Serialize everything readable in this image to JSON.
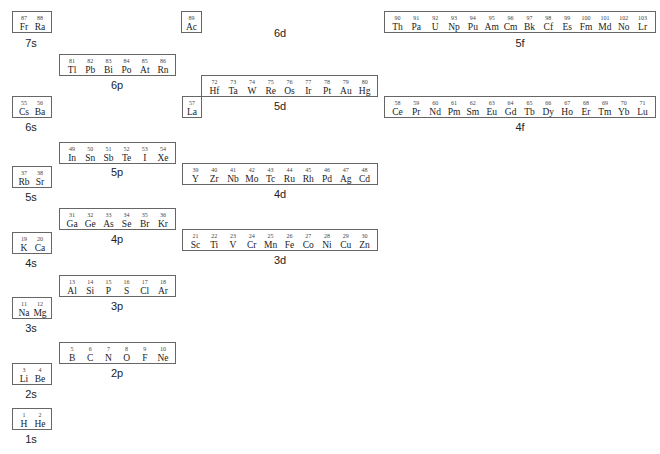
{
  "blocks": [
    {
      "id": "7s",
      "label": "7s",
      "x": 12,
      "y": 11,
      "w": 40,
      "h": 22,
      "lx": 31,
      "ly": 37,
      "elements": [
        {
          "n": "87",
          "s": "Fr"
        },
        {
          "n": "88",
          "s": "Ra"
        }
      ]
    },
    {
      "id": "6d",
      "label": "6d",
      "x": 181,
      "y": 11,
      "w": 21,
      "h": 22,
      "lx": 280,
      "ly": 27,
      "elements": [
        {
          "n": "89",
          "s": "Ac"
        }
      ]
    },
    {
      "id": "5f",
      "label": "5f",
      "x": 384,
      "y": 11,
      "w": 272,
      "h": 22,
      "lx": 520,
      "ly": 37,
      "elements": [
        {
          "n": "90",
          "s": "Th"
        },
        {
          "n": "91",
          "s": "Pa"
        },
        {
          "n": "92",
          "s": "U"
        },
        {
          "n": "93",
          "s": "Np"
        },
        {
          "n": "94",
          "s": "Pu"
        },
        {
          "n": "95",
          "s": "Am"
        },
        {
          "n": "96",
          "s": "Cm"
        },
        {
          "n": "97",
          "s": "Bk"
        },
        {
          "n": "98",
          "s": "Cf"
        },
        {
          "n": "99",
          "s": "Es"
        },
        {
          "n": "100",
          "s": "Fm"
        },
        {
          "n": "101",
          "s": "Md"
        },
        {
          "n": "102",
          "s": "No"
        },
        {
          "n": "103",
          "s": "Lr"
        }
      ]
    },
    {
      "id": "6p",
      "label": "6p",
      "x": 59,
      "y": 54,
      "w": 117,
      "h": 22,
      "lx": 117,
      "ly": 79,
      "elements": [
        {
          "n": "81",
          "s": "Tl"
        },
        {
          "n": "82",
          "s": "Pb"
        },
        {
          "n": "83",
          "s": "Bi"
        },
        {
          "n": "84",
          "s": "Po"
        },
        {
          "n": "85",
          "s": "At"
        },
        {
          "n": "86",
          "s": "Rn"
        }
      ]
    },
    {
      "id": "5d",
      "label": "5d",
      "x": 201,
      "y": 75,
      "w": 177,
      "h": 22,
      "lx": 280,
      "ly": 100,
      "elements": [
        {
          "n": "72",
          "s": "Hf"
        },
        {
          "n": "73",
          "s": "Ta"
        },
        {
          "n": "74",
          "s": "W"
        },
        {
          "n": "75",
          "s": "Re"
        },
        {
          "n": "76",
          "s": "Os"
        },
        {
          "n": "77",
          "s": "Ir"
        },
        {
          "n": "78",
          "s": "Pt"
        },
        {
          "n": "79",
          "s": "Au"
        },
        {
          "n": "80",
          "s": "Hg"
        }
      ]
    },
    {
      "id": "5d-La",
      "label": "",
      "x": 182,
      "y": 96,
      "w": 20,
      "h": 22,
      "lx": 0,
      "ly": 0,
      "elements": [
        {
          "n": "57",
          "s": "La"
        }
      ]
    },
    {
      "id": "6s",
      "label": "6s",
      "x": 12,
      "y": 96,
      "w": 40,
      "h": 22,
      "lx": 31,
      "ly": 121,
      "elements": [
        {
          "n": "55",
          "s": "Cs"
        },
        {
          "n": "56",
          "s": "Ba"
        }
      ]
    },
    {
      "id": "4f",
      "label": "4f",
      "x": 384,
      "y": 96,
      "w": 272,
      "h": 22,
      "lx": 520,
      "ly": 121,
      "elements": [
        {
          "n": "58",
          "s": "Ce"
        },
        {
          "n": "59",
          "s": "Pr"
        },
        {
          "n": "60",
          "s": "Nd"
        },
        {
          "n": "61",
          "s": "Pm"
        },
        {
          "n": "62",
          "s": "Sm"
        },
        {
          "n": "63",
          "s": "Eu"
        },
        {
          "n": "64",
          "s": "Gd"
        },
        {
          "n": "65",
          "s": "Tb"
        },
        {
          "n": "66",
          "s": "Dy"
        },
        {
          "n": "67",
          "s": "Ho"
        },
        {
          "n": "68",
          "s": "Er"
        },
        {
          "n": "69",
          "s": "Tm"
        },
        {
          "n": "70",
          "s": "Yb"
        },
        {
          "n": "71",
          "s": "Lu"
        }
      ]
    },
    {
      "id": "5p",
      "label": "5p",
      "x": 59,
      "y": 142,
      "w": 117,
      "h": 22,
      "lx": 117,
      "ly": 166,
      "elements": [
        {
          "n": "49",
          "s": "In"
        },
        {
          "n": "50",
          "s": "Sn"
        },
        {
          "n": "51",
          "s": "Sb"
        },
        {
          "n": "52",
          "s": "Te"
        },
        {
          "n": "53",
          "s": "I"
        },
        {
          "n": "54",
          "s": "Xe"
        }
      ]
    },
    {
      "id": "5s",
      "label": "5s",
      "x": 12,
      "y": 166,
      "w": 40,
      "h": 22,
      "lx": 31,
      "ly": 191,
      "elements": [
        {
          "n": "37",
          "s": "Rb"
        },
        {
          "n": "38",
          "s": "Sr"
        }
      ]
    },
    {
      "id": "4d",
      "label": "4d",
      "x": 182,
      "y": 163,
      "w": 196,
      "h": 22,
      "lx": 280,
      "ly": 188,
      "elements": [
        {
          "n": "39",
          "s": "Y"
        },
        {
          "n": "40",
          "s": "Zr"
        },
        {
          "n": "41",
          "s": "Nb"
        },
        {
          "n": "42",
          "s": "Mo"
        },
        {
          "n": "43",
          "s": "Tc"
        },
        {
          "n": "44",
          "s": "Ru"
        },
        {
          "n": "45",
          "s": "Rh"
        },
        {
          "n": "46",
          "s": "Pd"
        },
        {
          "n": "47",
          "s": "Ag"
        },
        {
          "n": "48",
          "s": "Cd"
        }
      ]
    },
    {
      "id": "4p",
      "label": "4p",
      "x": 59,
      "y": 208,
      "w": 117,
      "h": 22,
      "lx": 117,
      "ly": 233,
      "elements": [
        {
          "n": "31",
          "s": "Ga"
        },
        {
          "n": "32",
          "s": "Ge"
        },
        {
          "n": "33",
          "s": "As"
        },
        {
          "n": "34",
          "s": "Se"
        },
        {
          "n": "35",
          "s": "Br"
        },
        {
          "n": "36",
          "s": "Kr"
        }
      ]
    },
    {
      "id": "3d",
      "label": "3d",
      "x": 182,
      "y": 229,
      "w": 196,
      "h": 22,
      "lx": 280,
      "ly": 254,
      "elements": [
        {
          "n": "21",
          "s": "Sc"
        },
        {
          "n": "22",
          "s": "Ti"
        },
        {
          "n": "23",
          "s": "V"
        },
        {
          "n": "24",
          "s": "Cr"
        },
        {
          "n": "25",
          "s": "Mn"
        },
        {
          "n": "26",
          "s": "Fe"
        },
        {
          "n": "27",
          "s": "Co"
        },
        {
          "n": "28",
          "s": "Ni"
        },
        {
          "n": "29",
          "s": "Cu"
        },
        {
          "n": "30",
          "s": "Zn"
        }
      ]
    },
    {
      "id": "4s",
      "label": "4s",
      "x": 12,
      "y": 232,
      "w": 40,
      "h": 22,
      "lx": 31,
      "ly": 257,
      "elements": [
        {
          "n": "19",
          "s": "K"
        },
        {
          "n": "20",
          "s": "Ca"
        }
      ]
    },
    {
      "id": "3p",
      "label": "3p",
      "x": 59,
      "y": 275,
      "w": 117,
      "h": 22,
      "lx": 117,
      "ly": 300,
      "elements": [
        {
          "n": "13",
          "s": "Al"
        },
        {
          "n": "14",
          "s": "Si"
        },
        {
          "n": "15",
          "s": "P"
        },
        {
          "n": "16",
          "s": "S"
        },
        {
          "n": "17",
          "s": "Cl"
        },
        {
          "n": "18",
          "s": "Ar"
        }
      ]
    },
    {
      "id": "3s",
      "label": "3s",
      "x": 12,
      "y": 297,
      "w": 40,
      "h": 22,
      "lx": 31,
      "ly": 322,
      "elements": [
        {
          "n": "11",
          "s": "Na"
        },
        {
          "n": "12",
          "s": "Mg"
        }
      ]
    },
    {
      "id": "2p",
      "label": "2p",
      "x": 59,
      "y": 342,
      "w": 117,
      "h": 22,
      "lx": 117,
      "ly": 367,
      "elements": [
        {
          "n": "5",
          "s": "B"
        },
        {
          "n": "6",
          "s": "C"
        },
        {
          "n": "7",
          "s": "N"
        },
        {
          "n": "8",
          "s": "O"
        },
        {
          "n": "9",
          "s": "F"
        },
        {
          "n": "10",
          "s": "Ne"
        }
      ]
    },
    {
      "id": "2s",
      "label": "2s",
      "x": 12,
      "y": 363,
      "w": 40,
      "h": 22,
      "lx": 31,
      "ly": 388,
      "elements": [
        {
          "n": "3",
          "s": "Li"
        },
        {
          "n": "4",
          "s": "Be"
        }
      ]
    },
    {
      "id": "1s",
      "label": "1s",
      "x": 12,
      "y": 408,
      "w": 40,
      "h": 22,
      "lx": 31,
      "ly": 433,
      "elements": [
        {
          "n": "1",
          "s": "H"
        },
        {
          "n": "2",
          "s": "He"
        }
      ]
    }
  ]
}
